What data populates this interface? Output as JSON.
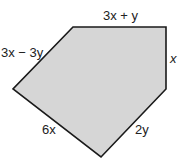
{
  "diagram": {
    "shape": "pentagon",
    "fill_color": "#d6d6d6",
    "stroke_color": "#1a1a1a",
    "vertices": [
      [
        73,
        27
      ],
      [
        166,
        27
      ],
      [
        166,
        89
      ],
      [
        101,
        157
      ],
      [
        13,
        89
      ]
    ],
    "side_labels": {
      "top": "3x + y",
      "right": "x",
      "bottom_right": "2y",
      "bottom_left": "6x",
      "top_left": "3x − 3y"
    }
  }
}
